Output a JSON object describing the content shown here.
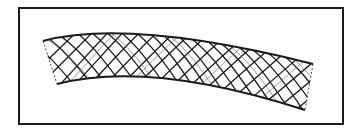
{
  "figure": {
    "subject": "stent",
    "colors": {
      "line": "#1a1a1a",
      "background": "#ffffff"
    }
  }
}
